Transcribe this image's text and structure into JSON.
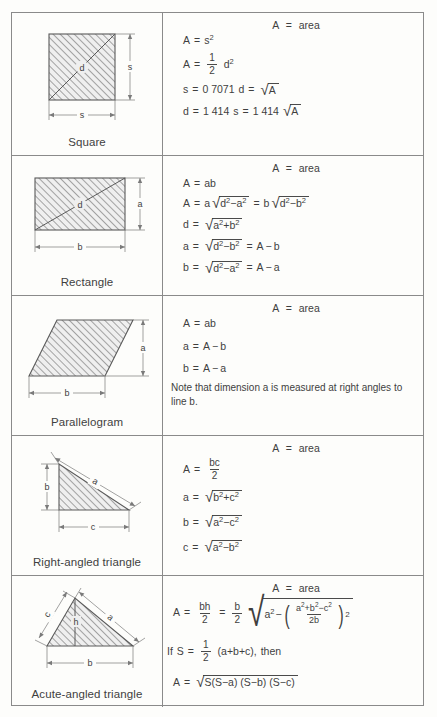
{
  "document": {
    "title": "Areas of plane figures",
    "rows": [
      {
        "shape_name": "Square",
        "figure": "square-with-diagonal",
        "labels": {
          "side": "s",
          "diagonal": "d"
        },
        "area_header": "A = area",
        "formulas": [
          "A = s²",
          "A = ½ d²",
          "s = 0.7071 d = √A",
          "d = 1.414 s = 1.414 √A"
        ],
        "constants": {
          "s_factor": "0.7071",
          "d_factor": "1.414"
        }
      },
      {
        "shape_name": "Rectangle",
        "figure": "rectangle-with-diagonal",
        "labels": {
          "height": "a",
          "base": "b",
          "diagonal": "d"
        },
        "area_header": "A = area",
        "formulas": [
          "A = ab",
          "A = a √(d²−a²) = b √(d²−b²)",
          "d = √(a²+b²)",
          "a = √(d²−b²) = A ÷ b",
          "b = √(d²−a²) = A ÷ a"
        ]
      },
      {
        "shape_name": "Parallelogram",
        "figure": "parallelogram",
        "labels": {
          "height": "a",
          "base": "b"
        },
        "area_header": "A = area",
        "formulas": [
          "A = ab",
          "a = A ÷ b",
          "b = A ÷ a"
        ],
        "note": "Note that dimension a is measured at right angles to line b."
      },
      {
        "shape_name": "Right-angled triangle",
        "figure": "right-angled-triangle",
        "labels": {
          "vertical": "b",
          "base": "c",
          "hypotenuse": "a"
        },
        "area_header": "A = area",
        "formulas": [
          "A = bc/2",
          "a = √(b²+c²)",
          "b = √(a²−c²)",
          "c = √(a²−b²)"
        ]
      },
      {
        "shape_name": "Acute-angled triangle",
        "figure": "acute-angled-triangle",
        "labels": {
          "left_side": "c",
          "right_side": "a",
          "base": "b",
          "height": "h"
        },
        "area_header": "A = area",
        "formulas": [
          "A = bh/2 = (b/2) √(a² − ((a²+b²−c²)/2b)²)",
          "If S = ½ (a+b+c), then",
          "A = √(S(S−a)(S−b)(S−c))"
        ],
        "condition_text": "then"
      }
    ]
  },
  "symbols": {
    "A": "A",
    "a": "a",
    "b": "b",
    "c": "c",
    "d": "d",
    "h": "h",
    "s": "s",
    "S": "S",
    "area_word": "area",
    "equals": "=",
    "minus": "−",
    "plus": "+",
    "if_word": "If",
    "then_word": "then",
    "two": "2",
    "one": "1",
    "2b": "2b",
    "bc": "bc",
    "bh": "bh",
    "ab": "ab",
    "val_07071": "0 7071",
    "val_1414": "1 414",
    "s_sq": "s",
    "exp2": "2"
  },
  "colors": {
    "border": "#8a8a8a",
    "text": "#3f3f3f",
    "hatch": "#6e6e6e",
    "fill": "#efefef",
    "page": "#fdfdfb"
  }
}
